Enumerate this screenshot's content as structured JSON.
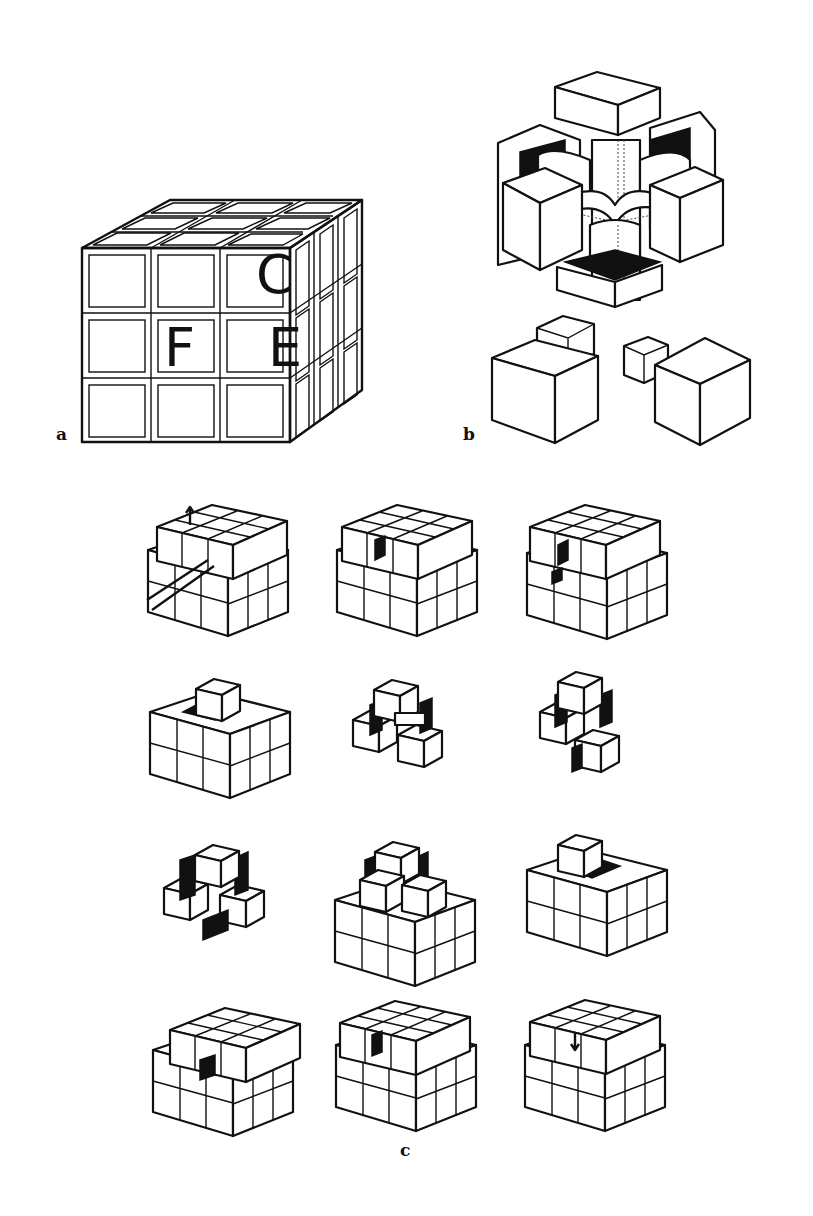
{
  "figure": {
    "panels": [
      {
        "id": "a",
        "label": "a",
        "description": "3x3x3 cube with face labels",
        "face_labels": [
          "C",
          "F",
          "E"
        ]
      },
      {
        "id": "b",
        "label": "b",
        "description": "exploded view of core mechanism with center pieces and corner/edge cubies"
      },
      {
        "id": "c",
        "label": "c",
        "description": "12-step disassembly/reassembly sequence",
        "grid": {
          "rows": 4,
          "cols": 3
        }
      }
    ],
    "colors": {
      "ink": "#111111",
      "background": "#ffffff"
    }
  }
}
